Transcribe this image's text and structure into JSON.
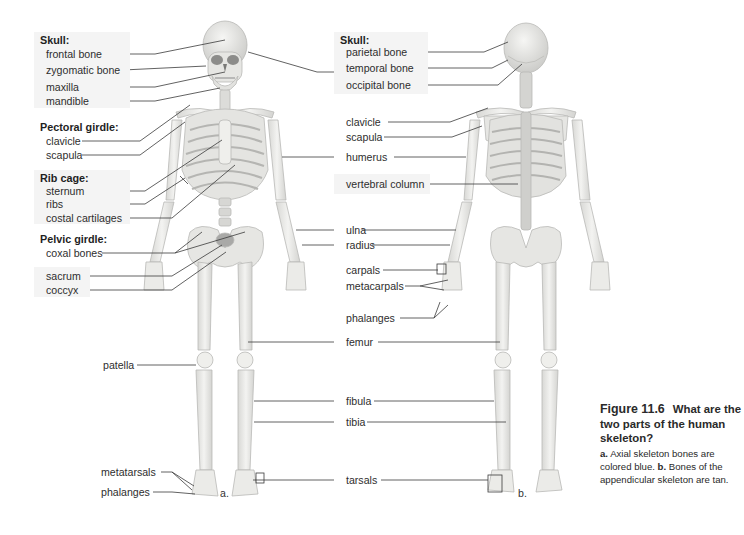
{
  "figure": {
    "panel_a_label": "a.",
    "panel_b_label": "b.",
    "colors": {
      "bone": "#ececea",
      "bone_shade": "#cfcfcc",
      "leader": "#3a3a3a",
      "label_bg": "#f4f4f4",
      "text": "#2e2e2e"
    }
  },
  "left_labels": {
    "skull": {
      "header": "Skull:",
      "items": [
        "frontal bone",
        "zygomatic bone",
        "maxilla",
        "mandible"
      ]
    },
    "pectoral_girdle": {
      "header": "Pectoral girdle:",
      "items": [
        "clavicle",
        "scapula"
      ]
    },
    "rib_cage": {
      "header": "Rib cage:",
      "items": [
        "sternum",
        "ribs",
        "costal cartilages"
      ]
    },
    "pelvic_girdle": {
      "header": "Pelvic girdle:",
      "items": [
        "coxal bones",
        "sacrum",
        "coccyx"
      ]
    },
    "leg": {
      "items": [
        "patella",
        "metatarsals",
        "phalanges"
      ]
    }
  },
  "middle_labels": {
    "skull": {
      "header": "Skull:",
      "items": [
        "parietal bone",
        "temporal bone",
        "occipital bone"
      ]
    },
    "items": [
      "clavicle",
      "scapula",
      "humerus",
      "vertebral column",
      "ulna",
      "radius",
      "carpals",
      "metacarpals",
      "phalanges",
      "femur",
      "fibula",
      "tibia",
      "tarsals"
    ]
  },
  "caption": {
    "figure_number": "Figure 11.6",
    "title": "What are the two parts of the human skeleton?",
    "a_marker": "a.",
    "a_text": "Axial skeleton bones are colored blue.",
    "b_marker": "b.",
    "b_text": "Bones of the appendicular skeleton are tan."
  }
}
